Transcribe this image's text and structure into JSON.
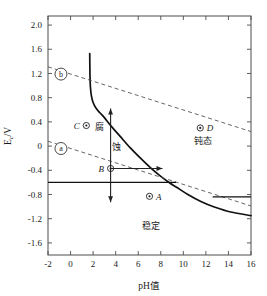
{
  "chart_data": {
    "type": "line",
    "title": "",
    "xlabel": "pH值",
    "ylabel": "Ec/V",
    "ylabel_main": "E",
    "ylabel_sub": "c",
    "ylabel_unit": "/V",
    "xlim": [
      -2,
      16
    ],
    "ylim": [
      -1.8,
      2.15
    ],
    "grid": false,
    "legend": "none",
    "xticks": [
      -2,
      0,
      2,
      4,
      6,
      8,
      10,
      12,
      14,
      16
    ],
    "xtick_labels": [
      "-2",
      "0",
      "2",
      "4",
      "6",
      "8",
      "10",
      "12",
      "14",
      "16"
    ],
    "yticks": [
      2.0,
      1.6,
      1.2,
      0.8,
      0.4,
      0,
      -0.4,
      -0.8,
      -1.2,
      -1.6
    ],
    "ytick_labels": [
      "2.0",
      "1.6",
      "1.2",
      "0.8",
      "0.4",
      "0",
      "-0.4",
      "-0.8",
      "-1.2",
      "-1.6"
    ],
    "series": [
      {
        "name": "passivation-boundary",
        "style": "solid",
        "points": [
          [
            1.7,
            1.53
          ],
          [
            1.72,
            1.2
          ],
          [
            1.76,
            0.98
          ],
          [
            1.85,
            0.83
          ],
          [
            2.0,
            0.72
          ],
          [
            2.25,
            0.63
          ],
          [
            2.6,
            0.55
          ],
          [
            3.0,
            0.47
          ],
          [
            3.6,
            0.33
          ],
          [
            4.4,
            0.16
          ],
          [
            5.3,
            -0.03
          ],
          [
            6.2,
            -0.2
          ],
          [
            7.1,
            -0.36
          ],
          [
            8.0,
            -0.5
          ],
          [
            8.8,
            -0.61
          ],
          [
            9.4,
            -0.68
          ],
          [
            10.4,
            -0.8
          ],
          [
            11.6,
            -0.92
          ],
          [
            12.8,
            -1.01
          ],
          [
            14.2,
            -1.09
          ],
          [
            16.0,
            -1.15
          ]
        ]
      },
      {
        "name": "line-b-oxygen",
        "style": "dashed",
        "points": [
          [
            -2.0,
            1.31
          ],
          [
            16.0,
            0.24
          ]
        ]
      },
      {
        "name": "line-a-hydrogen",
        "style": "dashed",
        "points": [
          [
            -2.0,
            0.08
          ],
          [
            16.0,
            -0.99
          ]
        ]
      },
      {
        "name": "equilibrium-left",
        "style": "solid-thin",
        "points": [
          [
            -2.0,
            -0.6
          ],
          [
            9.35,
            -0.6
          ]
        ]
      },
      {
        "name": "equilibrium-right",
        "style": "solid-thin",
        "points": [
          [
            12.6,
            -0.84
          ],
          [
            16.0,
            -0.84
          ]
        ]
      }
    ],
    "points": [
      {
        "label": "A",
        "x": 7.0,
        "y": -0.83,
        "label_side": "right"
      },
      {
        "label": "B",
        "x": 3.55,
        "y": -0.37,
        "label_side": "left"
      },
      {
        "label": "C",
        "x": 1.4,
        "y": 0.34,
        "label_side": "left"
      },
      {
        "label": "D",
        "x": 11.5,
        "y": 0.3,
        "label_side": "right"
      }
    ],
    "annotations": [
      {
        "name": "corrosion-region",
        "text": "腐",
        "x": 2.55,
        "y": 0.26
      },
      {
        "name": "corrosion-region-2",
        "text": "蚀",
        "x": 4.1,
        "y": -0.06
      },
      {
        "name": "passive-region",
        "text": "钝态",
        "x": 11.7,
        "y": 0.03
      },
      {
        "name": "stable-region",
        "text": "稳定",
        "x": 7.1,
        "y": -1.37
      },
      {
        "name": "line-marker-b",
        "text": "b",
        "x": -0.85,
        "y": 1.19
      },
      {
        "name": "line-marker-a",
        "text": "a",
        "x": -0.85,
        "y": -0.04
      }
    ],
    "arrows": [
      {
        "name": "arrow-up",
        "x1": 3.55,
        "y1": -0.37,
        "x2": 3.55,
        "y2": 0.62,
        "direction": "up"
      },
      {
        "name": "arrow-down",
        "x1": 3.55,
        "y1": -0.37,
        "x2": 3.55,
        "y2": -0.93,
        "direction": "down"
      },
      {
        "name": "arrow-right",
        "x1": 3.55,
        "y1": -0.37,
        "x2": 8.15,
        "y2": -0.37,
        "direction": "right"
      }
    ],
    "colors": {
      "curve": "#111111",
      "dashed": "#555555",
      "frame": "#4d4d4d",
      "background": "#ffffff"
    }
  }
}
